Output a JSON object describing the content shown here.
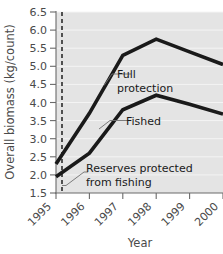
{
  "chart_data": {
    "type": "line",
    "title": "",
    "xlabel": "Year",
    "ylabel": "Overall biomass (kg/count)",
    "x": [
      1995,
      1996,
      1997,
      1998,
      1999,
      2000
    ],
    "xticklabels": [
      "1995",
      "1996",
      "1997",
      "1998",
      "1999",
      "2000"
    ],
    "yticklabels": [
      "6.5",
      "6.0",
      "5.5",
      "5.0",
      "4.5",
      "4.0",
      "3.5",
      "3.0",
      "2.5",
      "2.0",
      "1.5"
    ],
    "ytickvalues": [
      6.5,
      6.0,
      5.5,
      5.0,
      4.5,
      4.0,
      3.5,
      3.0,
      2.5,
      2.0,
      1.5
    ],
    "ylim": [
      1.5,
      6.5
    ],
    "xlim": [
      1995,
      2000
    ],
    "grid": true,
    "legend_position": "inline-annotations",
    "series": [
      {
        "name": "Full protection",
        "values": [
          2.3,
          3.7,
          5.3,
          5.75,
          5.4,
          5.05
        ]
      },
      {
        "name": "Fished",
        "values": [
          1.95,
          2.6,
          3.8,
          4.2,
          3.95,
          3.68
        ]
      }
    ],
    "annotations": [
      {
        "id": "full-protection",
        "lines": [
          "Full",
          "protection"
        ],
        "text": "Full protection"
      },
      {
        "id": "fished",
        "lines": [
          "Fished"
        ],
        "text": "Fished"
      },
      {
        "id": "reserves-protected",
        "lines": [
          "Reserves protected",
          "from fishing"
        ],
        "text": "Reserves protected from fishing"
      }
    ],
    "event_marker": {
      "label": "Reserves protected from fishing",
      "x": 1995.15,
      "style": "dashed-vertical"
    },
    "colors": {
      "plot_background": "#e4e4e4",
      "line": "#1a1a1a",
      "gridline": "#f4f4f4",
      "axis": "#6a6a6a",
      "tick_label": "#4a4a4a",
      "annotation_text": "#1a1a1a",
      "leader_line": "#6f6f6f"
    }
  }
}
